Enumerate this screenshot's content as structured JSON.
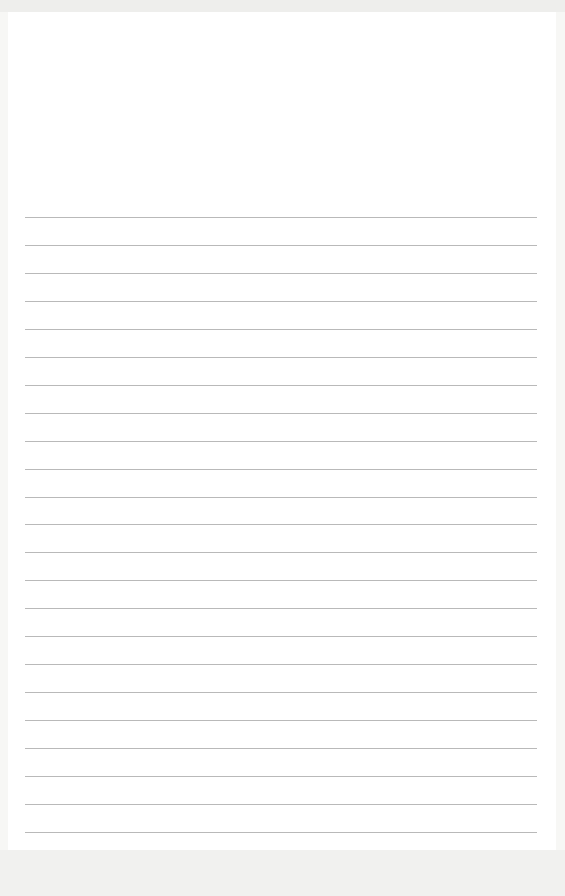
{
  "page": {
    "type": "lined-paper",
    "background_color": "#ffffff",
    "rule_color": "#b9b9b9",
    "rule_count": 23,
    "rule_start_y": 217,
    "rule_spacing": 27.95,
    "rule_left": 25,
    "rule_width": 512
  }
}
